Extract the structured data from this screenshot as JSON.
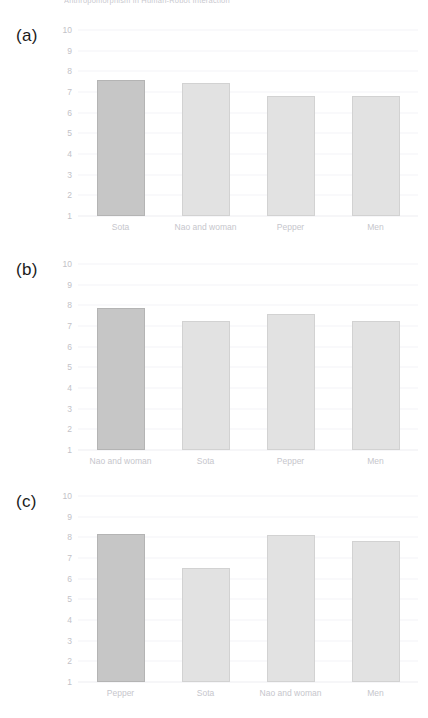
{
  "running_head": "Anthropomorphism in Human-Robot Interaction",
  "panels": [
    {
      "label": "(a)"
    },
    {
      "label": "(b)"
    },
    {
      "label": "(c)"
    }
  ],
  "axis": {
    "yticks": [
      10,
      9,
      8,
      7,
      6,
      5,
      4,
      3,
      2,
      1
    ]
  },
  "colors": {
    "bar_light": "#e2e2e2",
    "bar_dark": "#c6c6c6",
    "grid": "#f4f4f7",
    "tick_text": "#c2c2c8",
    "panel_label": "#1b1b1b"
  },
  "chart_data": [
    {
      "type": "bar",
      "title": "(a)",
      "categories": [
        "Sota",
        "Nao and woman",
        "Pepper",
        "Men"
      ],
      "values": [
        7.6,
        7.45,
        6.8,
        6.8
      ],
      "xlabel": "",
      "ylabel": "",
      "ylim": [
        1,
        10
      ],
      "yticks": [
        1,
        2,
        3,
        4,
        5,
        6,
        7,
        8,
        9,
        10
      ],
      "grid": true,
      "legend": "none",
      "highlight_index": 0
    },
    {
      "type": "bar",
      "title": "(b)",
      "categories": [
        "Nao and woman",
        "Sota",
        "Pepper",
        "Men"
      ],
      "values": [
        7.85,
        7.25,
        7.6,
        7.25
      ],
      "xlabel": "",
      "ylabel": "",
      "ylim": [
        1,
        10
      ],
      "yticks": [
        1,
        2,
        3,
        4,
        5,
        6,
        7,
        8,
        9,
        10
      ],
      "grid": true,
      "legend": "none",
      "highlight_index": 0
    },
    {
      "type": "bar",
      "title": "(c)",
      "categories": [
        "Pepper",
        "Sota",
        "Nao and woman",
        "Men"
      ],
      "values": [
        8.15,
        6.5,
        8.1,
        7.8
      ],
      "xlabel": "",
      "ylabel": "",
      "ylim": [
        1,
        10
      ],
      "yticks": [
        1,
        2,
        3,
        4,
        5,
        6,
        7,
        8,
        9,
        10
      ],
      "grid": true,
      "legend": "none",
      "highlight_index": 0
    }
  ]
}
